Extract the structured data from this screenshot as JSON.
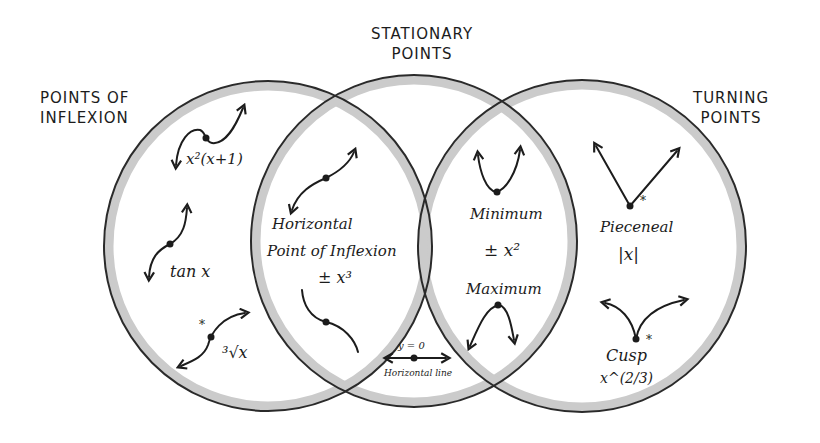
{
  "diagram": {
    "type": "venn",
    "sets": [
      {
        "id": "inflexion",
        "title_line1": "POINTS OF",
        "title_line2": "INFLEXION"
      },
      {
        "id": "stationary",
        "title_line1": "STATIONARY",
        "title_line2": "POINTS"
      },
      {
        "id": "turning",
        "title_line1": "TURNING",
        "title_line2": "POINTS"
      }
    ],
    "regions": {
      "inflexion_only": {
        "items": [
          {
            "label": "x²(x+1)",
            "sketch": "cubic-with-inflection"
          },
          {
            "label": "tan x",
            "sketch": "tan-curve"
          },
          {
            "label": "³√x",
            "sketch": "cube-root-curve",
            "marker": "*"
          }
        ]
      },
      "inflexion_and_stationary": {
        "line1": "Horizontal",
        "line2": "Point of Inflexion",
        "formula": "± x³",
        "sketches": [
          "increasing-cubic",
          "decreasing-cubic"
        ]
      },
      "stationary_only": {
        "equation": "y = 0",
        "caption": "Horizontal line",
        "sketch": "horizontal-line-with-point"
      },
      "stationary_and_turning": {
        "minimum_label": "Minimum",
        "formula": "± x²",
        "maximum_label": "Maximum",
        "sketches": [
          "parabola-up",
          "parabola-down"
        ]
      },
      "turning_only": {
        "items": [
          {
            "label": "Pieceneal",
            "formula": "|x|",
            "sketch": "v-shape",
            "marker": "*"
          },
          {
            "label": "Cusp",
            "formula": "x^(2/3)",
            "sketch": "cusp",
            "marker": "*"
          }
        ]
      }
    },
    "colors": {
      "outline": "#2a2a2a",
      "rim": "#c8c8c8",
      "background": "#ffffff",
      "ink": "#1c1c1c"
    }
  }
}
